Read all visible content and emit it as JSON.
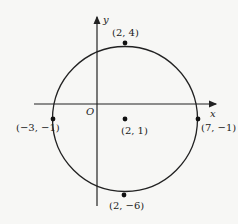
{
  "diagram": {
    "type": "coordinate-circle",
    "axes": {
      "x_label": "x",
      "y_label": "y",
      "origin_label": "O"
    },
    "circle": {
      "center_label": "(2, 1)",
      "stroke": "#222222"
    },
    "points": [
      {
        "id": "top",
        "label": "(2, 4)"
      },
      {
        "id": "left",
        "label": "(−3, −1)"
      },
      {
        "id": "right",
        "label": "(7, −1)"
      },
      {
        "id": "center",
        "label": "(2, 1)"
      },
      {
        "id": "bottom",
        "label": "(2, −6)"
      }
    ]
  }
}
